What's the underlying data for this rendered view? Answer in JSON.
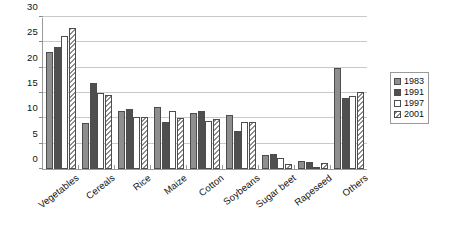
{
  "chart_data": {
    "type": "bar",
    "title": "",
    "xlabel": "",
    "ylabel": "",
    "ylim": [
      0,
      30
    ],
    "ytick_step": 5,
    "yticks": [
      "0",
      "5",
      "10",
      "15",
      "20",
      "25",
      "30"
    ],
    "grid": true,
    "legend_position": "right",
    "categories": [
      "Vegetables",
      "Cereals",
      "Rice",
      "Maize",
      "Cotton",
      "Soybeans",
      "Sugar beet",
      "Rapeseed",
      "Others"
    ],
    "series": [
      {
        "name": "1983",
        "color": "#8e8e8e",
        "pattern": "solid-medium-gray",
        "values": [
          23.0,
          9.0,
          11.5,
          12.3,
          11.0,
          10.7,
          2.7,
          1.5,
          20.0
        ]
      },
      {
        "name": "1991",
        "color": "#4f4f4f",
        "pattern": "solid-dark-gray",
        "values": [
          24.0,
          17.0,
          11.8,
          9.3,
          11.5,
          7.5,
          3.0,
          1.4,
          14.0
        ]
      },
      {
        "name": "1997",
        "color": "#ffffff",
        "pattern": "empty-white",
        "values": [
          26.2,
          15.0,
          10.3,
          11.5,
          9.5,
          9.3,
          2.2,
          0.2,
          14.5
        ]
      },
      {
        "name": "2001",
        "color": "#ffffff",
        "pattern": "diagonal-hatch",
        "values": [
          27.8,
          14.7,
          10.3,
          10.0,
          9.8,
          9.3,
          1.0,
          1.2,
          15.2
        ]
      }
    ]
  }
}
